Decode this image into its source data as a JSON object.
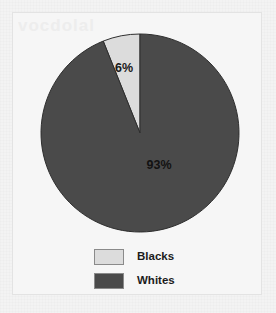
{
  "page": {
    "background_color": "#f2f2f2",
    "frame_border_color": "#e3e3e3",
    "watermark_text": "vocdolal"
  },
  "legend": {
    "items": [
      {
        "label": "Blacks",
        "color": "#dcdcdc"
      },
      {
        "label": "Whites",
        "color": "#4a4a4a"
      }
    ]
  },
  "chart_data": {
    "type": "pie",
    "title": "",
    "subtitle": "",
    "xlabel": "",
    "ylabel": "",
    "grid": false,
    "legend_position": "bottom",
    "start_angle_deg": 0,
    "direction": "counterclockwise",
    "center": {
      "x": 140,
      "y": 133
    },
    "radius": 99,
    "categories": [
      "Blacks",
      "Whites"
    ],
    "values": [
      6,
      93
    ],
    "data_labels": [
      "6%",
      "93%"
    ],
    "colors": [
      "#dcdcdc",
      "#4a4a4a"
    ],
    "slices": [
      {
        "name": "Blacks",
        "value": 6,
        "label": "6%",
        "color": "#dcdcdc",
        "label_x": 124,
        "label_y": 72
      },
      {
        "name": "Whites",
        "value": 93,
        "label": "93%",
        "color": "#4a4a4a",
        "label_x": 159,
        "label_y": 169
      }
    ]
  }
}
